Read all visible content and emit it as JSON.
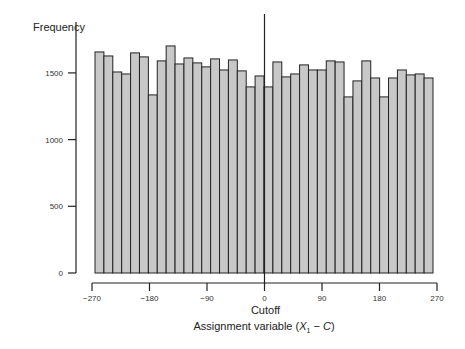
{
  "chart_data": {
    "type": "bar",
    "title": "",
    "ylabel": "Frequency",
    "xlabel": "Assignment variable (X1 − C)",
    "xlabel_parts": {
      "pre": "Assignment variable (",
      "var": "X",
      "sub": "1",
      "post": " − ",
      "c": "C",
      "end": ")"
    },
    "annotation": "Cutoff",
    "cutoff_x": 0,
    "xlim": [
      -270,
      270
    ],
    "ylim": [
      0,
      1700
    ],
    "xticks": [
      -270,
      -180,
      -90,
      0,
      90,
      180,
      270
    ],
    "xtick_labels": [
      "−270",
      "−180",
      "−90",
      "0",
      "90",
      "180",
      "270"
    ],
    "yticks": [
      0,
      500,
      1000,
      1500
    ],
    "ytick_labels": [
      "0",
      "500",
      "1000",
      "1500"
    ],
    "grid": false,
    "bar_color": "#c8c8c8",
    "edge_color": "#222222",
    "bin_width": 14.2,
    "values": [
      1657,
      1627,
      1507,
      1492,
      1650,
      1620,
      1335,
      1590,
      1702,
      1567,
      1612,
      1575,
      1545,
      1605,
      1522,
      1597,
      1515,
      1395,
      1477,
      1395,
      1582,
      1470,
      1492,
      1560,
      1522,
      1522,
      1590,
      1582,
      1320,
      1440,
      1590,
      1462,
      1320,
      1462,
      1522,
      1485,
      1492,
      1462
    ]
  }
}
